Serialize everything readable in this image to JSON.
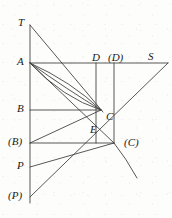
{
  "figure": {
    "background_color": "#fdfdfc",
    "stroke_color": "#3a3a3a",
    "label_color": "#1a1a1a",
    "width": 172,
    "height": 218,
    "labels": [
      {
        "id": "T",
        "text": "T",
        "x": 18,
        "y": 17
      },
      {
        "id": "A",
        "text": "A",
        "x": 17,
        "y": 56
      },
      {
        "id": "D",
        "text": "D",
        "x": 92,
        "y": 52
      },
      {
        "id": "Dp",
        "text": "(D)",
        "x": 108,
        "y": 52
      },
      {
        "id": "S",
        "text": "S",
        "x": 148,
        "y": 51
      },
      {
        "id": "B",
        "text": "B",
        "x": 17,
        "y": 103
      },
      {
        "id": "C",
        "text": "C",
        "x": 106,
        "y": 111
      },
      {
        "id": "E",
        "text": "E",
        "x": 90,
        "y": 124
      },
      {
        "id": "Bp",
        "text": "(B)",
        "x": 8,
        "y": 136
      },
      {
        "id": "Cp",
        "text": "(C)",
        "x": 124,
        "y": 137
      },
      {
        "id": "P",
        "text": "P",
        "x": 17,
        "y": 160
      },
      {
        "id": "Pp",
        "text": "(P)",
        "x": 8,
        "y": 190
      }
    ],
    "points": {
      "T": {
        "x": 30,
        "y": 25
      },
      "A": {
        "x": 30,
        "y": 63
      },
      "B": {
        "x": 30,
        "y": 110
      },
      "Bp": {
        "x": 30,
        "y": 143
      },
      "P": {
        "x": 30,
        "y": 167
      },
      "Pp": {
        "x": 30,
        "y": 197
      },
      "D": {
        "x": 96,
        "y": 63
      },
      "Dp": {
        "x": 114,
        "y": 63
      },
      "S": {
        "x": 168,
        "y": 63
      },
      "C": {
        "x": 101,
        "y": 110
      },
      "E": {
        "x": 96,
        "y": 118
      },
      "Cp": {
        "x": 114,
        "y": 143
      },
      "curve_end": {
        "x": 137,
        "y": 178
      }
    },
    "segments": [
      {
        "name": "vertical-axis",
        "x1": 30,
        "y1": 25,
        "x2": 30,
        "y2": 203
      },
      {
        "name": "horizontal-A-to-S",
        "x1": 30,
        "y1": 63,
        "x2": 168,
        "y2": 63
      },
      {
        "name": "horizontal-B-to-C",
        "x1": 30,
        "y1": 110,
        "x2": 101,
        "y2": 110
      },
      {
        "name": "horizontal-Bp-to-Cp",
        "x1": 30,
        "y1": 143,
        "x2": 114,
        "y2": 143
      },
      {
        "name": "vertical-D-to-C",
        "x1": 96,
        "y1": 63,
        "x2": 96,
        "y2": 143
      },
      {
        "name": "vertical-Dp-to-Cp",
        "x1": 114,
        "y1": 63,
        "x2": 114,
        "y2": 143
      },
      {
        "name": "line-T-to-C",
        "x1": 30,
        "y1": 25,
        "x2": 103,
        "y2": 112
      },
      {
        "name": "line-A-to-Cp",
        "x1": 30,
        "y1": 63,
        "x2": 114,
        "y2": 143
      },
      {
        "name": "line-P-to-Cp",
        "x1": 30,
        "y1": 167,
        "x2": 114,
        "y2": 143
      },
      {
        "name": "line-Pp-to-S",
        "x1": 30,
        "y1": 197,
        "x2": 168,
        "y2": 63
      },
      {
        "name": "line-Bp-to-C",
        "x1": 30,
        "y1": 143,
        "x2": 101,
        "y2": 110
      }
    ],
    "curves": [
      {
        "name": "curve-A-to-C-1",
        "x1": 30,
        "y1": 63,
        "cx": 72,
        "cy": 82,
        "x2": 101,
        "y2": 110
      },
      {
        "name": "curve-A-to-C-2",
        "x1": 30,
        "y1": 63,
        "cx": 68,
        "cy": 90,
        "x2": 101,
        "y2": 110
      },
      {
        "name": "curve-A-to-C-3",
        "x1": 30,
        "y1": 63,
        "cx": 63,
        "cy": 98,
        "x2": 101,
        "y2": 110
      },
      {
        "name": "curve-Cp-tail",
        "x1": 114,
        "y1": 143,
        "cx": 126,
        "cy": 158,
        "x2": 137,
        "y2": 178
      }
    ]
  }
}
